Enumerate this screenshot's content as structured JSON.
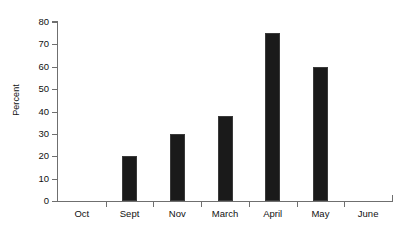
{
  "chart_data": {
    "type": "bar",
    "title": "",
    "subtitle": "",
    "xlabel": "",
    "ylabel": "Percent",
    "categories": [
      "Oct",
      "Sept",
      "Nov",
      "March",
      "April",
      "May",
      "June"
    ],
    "values": [
      0,
      20,
      30,
      38,
      75,
      60,
      0
    ],
    "ylim": [
      0,
      80
    ],
    "ytick_labels": [
      "0",
      "10",
      "20",
      "30",
      "40",
      "50",
      "60",
      "70",
      "80"
    ],
    "ytick_values": [
      0,
      10,
      20,
      30,
      40,
      50,
      60,
      70,
      80
    ],
    "grid": false,
    "legend": false,
    "legend_position": "none",
    "bar_color": "#1a1a1a",
    "axis_color": "#6f6f6f",
    "background_color": "#ffffff",
    "annotations": []
  }
}
